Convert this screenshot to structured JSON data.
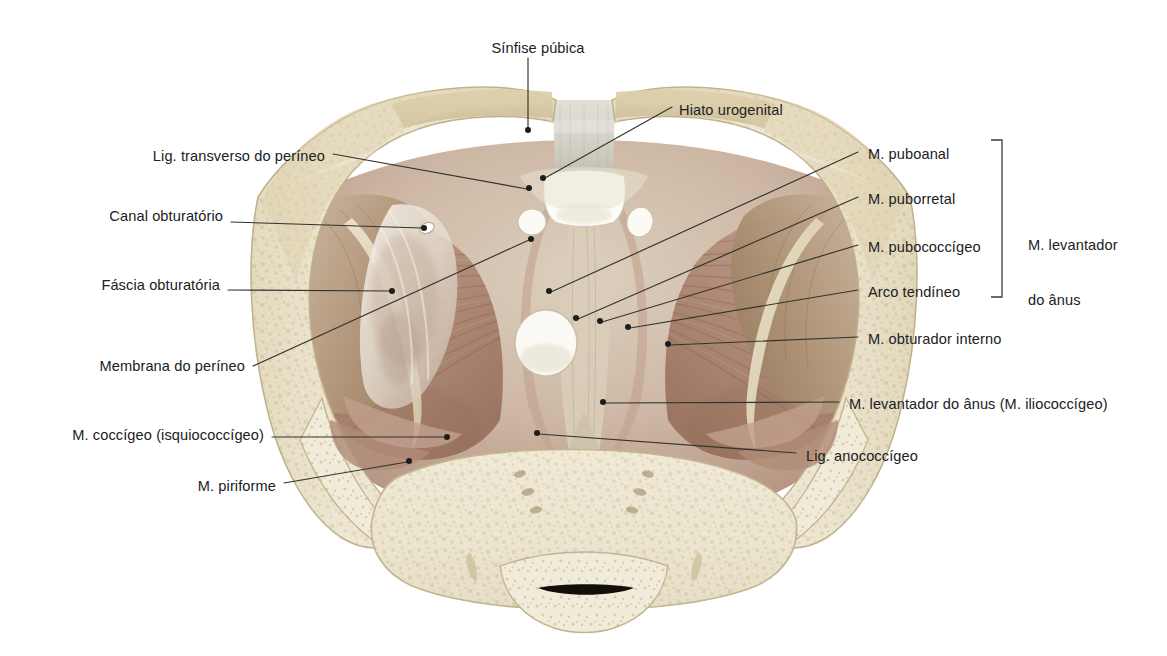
{
  "figure": {
    "language": "pt-BR",
    "background_color": "#ffffff",
    "leader_line_color": "#32332f",
    "text_color": "#20211f",
    "palette": {
      "bone_cortical": "#e4dcc0",
      "bone_trabecular": "#efe9d4",
      "bone_shadow": "#cfc4a2",
      "muscle_light": "#cdb0a2",
      "muscle_mid": "#b08c7c",
      "muscle_dark": "#8d6552",
      "fascia_white": "#f2eee6",
      "tendon_pale": "#ddd2b4",
      "symphysis_grey": "#d8d5cb",
      "hiatus_white": "#fdfcf8",
      "coccyx_slit": "#120f0a"
    }
  },
  "labels_left": [
    {
      "id": "lig-transverso-perineo",
      "text": "Lig. transverso do períneo",
      "x": 145,
      "y": 148,
      "anchor_x": 529,
      "anchor_y": 188
    },
    {
      "id": "canal-obturatorio",
      "text": "Canal obturatório",
      "x": 78,
      "y": 208,
      "anchor_x": 424,
      "anchor_y": 228
    },
    {
      "id": "fascia-obturatoria",
      "text": "Fáscia obturatória",
      "x": 75,
      "y": 277,
      "anchor_x": 392,
      "anchor_y": 291
    },
    {
      "id": "membrana-perineo",
      "text": "Membrana do períneo",
      "x": 52,
      "y": 358,
      "anchor_x": 531,
      "anchor_y": 239
    },
    {
      "id": "m-coccigeo",
      "text": "M. coccígeo (isquiococcígeo)",
      "x": 40,
      "y": 427,
      "anchor_x": 447,
      "anchor_y": 437
    },
    {
      "id": "m-piriforme",
      "text": "M. piriforme",
      "x": 196,
      "y": 478,
      "anchor_x": 409,
      "anchor_y": 461
    }
  ],
  "labels_top": [
    {
      "id": "sinfise-publica",
      "text": "Sínfise púbica",
      "x": 483,
      "y": 40,
      "anchor_x": 528,
      "anchor_y": 130
    },
    {
      "id": "hiato-urogenital",
      "text": "Hiato urogenital",
      "x": 679,
      "y": 102,
      "anchor_x": 543,
      "anchor_y": 178
    }
  ],
  "labels_right": [
    {
      "id": "m-puboanal",
      "text": "M. puboanal",
      "x": 868,
      "y": 146,
      "anchor_x": 549,
      "anchor_y": 291
    },
    {
      "id": "m-puborretal",
      "text": "M. puborretal",
      "x": 868,
      "y": 191,
      "anchor_x": 576,
      "anchor_y": 318
    },
    {
      "id": "m-pubococcigeo",
      "text": "M. pubococcígeo",
      "x": 868,
      "y": 239,
      "anchor_x": 600,
      "anchor_y": 321
    },
    {
      "id": "arco-tendineo",
      "text": "Arco tendíneo",
      "x": 868,
      "y": 284,
      "anchor_x": 628,
      "anchor_y": 327
    },
    {
      "id": "m-obturador-interno",
      "text": "M. obturador interno",
      "x": 868,
      "y": 331,
      "anchor_x": 668,
      "anchor_y": 344
    },
    {
      "id": "m-levantador-iliococcigeo",
      "text": "M. levantador do ânus (M. iliococcígeo)",
      "x": 849,
      "y": 396,
      "anchor_x": 603,
      "anchor_y": 402
    },
    {
      "id": "lig-anococcigeo",
      "text": "Lig. anococcígeo",
      "x": 806,
      "y": 448,
      "anchor_x": 537,
      "anchor_y": 433
    }
  ],
  "group_label": {
    "id": "m-levantador-do-anus",
    "line1": "M. levantador",
    "line2": "do ânus",
    "x": 1028,
    "y": 200,
    "bracket": {
      "x": 1002,
      "y_top": 140,
      "y_bottom": 297,
      "tick": 11
    }
  }
}
